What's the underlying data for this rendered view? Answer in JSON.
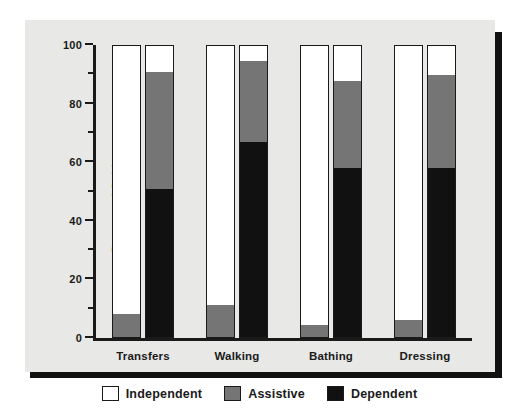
{
  "chart_data": {
    "type": "bar",
    "subtype": "stacked-bar-paired",
    "title": "",
    "xlabel": "",
    "ylabel": "Percent of Subjects",
    "ylim": [
      0,
      100
    ],
    "grid": false,
    "legend_position": "bottom-center",
    "categories": [
      "Transfers",
      "Walking",
      "Bathing",
      "Dressing"
    ],
    "stack_order_bottom_to_top": [
      "Dependent",
      "Assistive",
      "Independent"
    ],
    "legend": [
      {
        "label": "Independent",
        "color": "#ffffff"
      },
      {
        "label": "Assistive",
        "color": "#757575"
      },
      {
        "label": "Dependent",
        "color": "#111111"
      }
    ],
    "y_ticks_major": [
      0,
      20,
      40,
      60,
      80,
      100
    ],
    "y_ticks_minor": [
      10,
      30,
      50,
      70,
      90
    ],
    "y_tick_labels": [
      "0",
      "20",
      "40",
      "60",
      "80",
      "100"
    ],
    "groups": [
      {
        "category": "Transfers",
        "bars": [
          {
            "name": "bar-1",
            "Dependent": 0,
            "Assistive": 8,
            "Independent": 92
          },
          {
            "name": "bar-2",
            "Dependent": 51,
            "Assistive": 40,
            "Independent": 9
          }
        ]
      },
      {
        "category": "Walking",
        "bars": [
          {
            "name": "bar-1",
            "Dependent": 0,
            "Assistive": 11,
            "Independent": 89
          },
          {
            "name": "bar-2",
            "Dependent": 67,
            "Assistive": 28,
            "Independent": 5
          }
        ]
      },
      {
        "category": "Bathing",
        "bars": [
          {
            "name": "bar-1",
            "Dependent": 0,
            "Assistive": 4,
            "Independent": 96
          },
          {
            "name": "bar-2",
            "Dependent": 58,
            "Assistive": 30,
            "Independent": 12
          }
        ]
      },
      {
        "category": "Dressing",
        "bars": [
          {
            "name": "bar-1",
            "Dependent": 0,
            "Assistive": 6,
            "Independent": 94
          },
          {
            "name": "bar-2",
            "Dependent": 58,
            "Assistive": 32,
            "Independent": 10
          }
        ]
      }
    ],
    "colors": {
      "independent": "#ffffff",
      "assistive": "#757575",
      "dependent": "#111111",
      "axis": "#1a1a1a",
      "panel_background": "#e8e8e6",
      "figure_background": "#ffffff",
      "shadow": "#111111"
    }
  },
  "axis": {
    "y_title": "Percent of Subjects"
  }
}
